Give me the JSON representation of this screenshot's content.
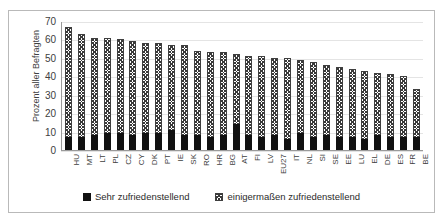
{
  "chart_data": {
    "type": "bar",
    "subtype": "stacked-bar",
    "title": "",
    "xlabel": "",
    "ylabel": "Prozent aller Befragten",
    "ylim": [
      0,
      70
    ],
    "yticks": [
      0,
      10,
      20,
      30,
      40,
      50,
      60,
      70
    ],
    "grid": true,
    "legend_position": "bottom",
    "categories": [
      "HU",
      "MT",
      "LT",
      "PL",
      "CZ",
      "CY",
      "DK",
      "PT",
      "IE",
      "SK",
      "RO",
      "HR",
      "BG",
      "AT",
      "FI",
      "LV",
      "EU27",
      "IT",
      "NL",
      "SI",
      "SE",
      "EE",
      "LU",
      "EL",
      "DE",
      "ES",
      "FR",
      "BE"
    ],
    "series": [
      {
        "name": "Sehr zufriedenstellend",
        "swatch": "solid-black",
        "color": "#111111",
        "values": [
          7,
          7,
          8,
          9,
          9,
          8,
          9,
          9,
          11,
          8,
          8,
          7,
          8,
          14,
          8,
          7,
          8,
          6,
          9,
          7,
          8,
          7,
          7,
          6,
          8,
          7,
          7,
          7
        ]
      },
      {
        "name": "einigermaßen zufriedenstellend",
        "swatch": "hatched",
        "color": "#3a3a3a",
        "values": [
          60,
          56,
          53,
          52,
          51,
          51,
          49,
          49,
          46,
          49,
          46,
          46,
          45,
          38,
          43,
          44,
          42,
          44,
          40,
          41,
          38,
          38,
          37,
          37,
          34,
          34,
          33,
          26
        ]
      }
    ],
    "totals": [
      67,
      63,
      61,
      61,
      60,
      59,
      58,
      58,
      57,
      57,
      54,
      53,
      53,
      52,
      51,
      51,
      50,
      50,
      49,
      48,
      46,
      45,
      44,
      43,
      42,
      41,
      40,
      33
    ]
  },
  "legend": {
    "items": [
      {
        "label": "Sehr zufriedenstellend"
      },
      {
        "label": "einigermaßen zufriedenstellend"
      }
    ]
  }
}
